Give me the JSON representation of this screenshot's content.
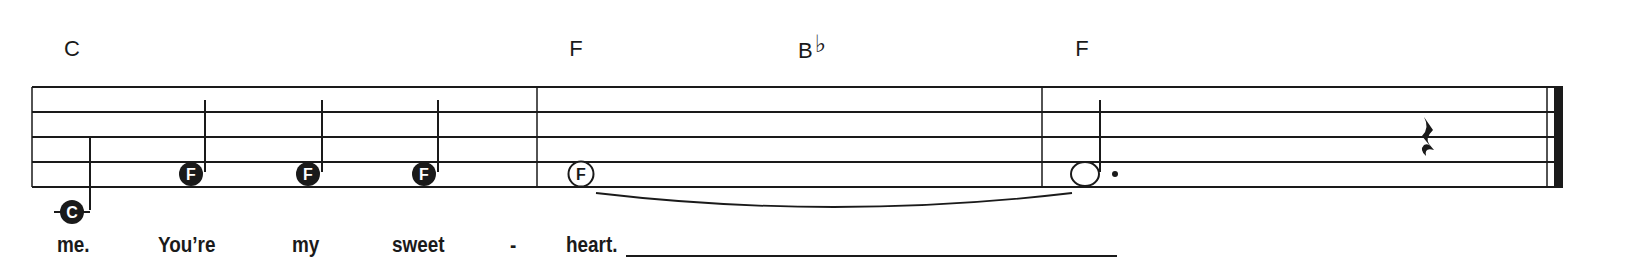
{
  "colors": {
    "ink": "#1a1a1a",
    "paper": "#ffffff",
    "note_label": "#ffffff"
  },
  "staff": {
    "left": 32,
    "right": 1563,
    "lines_y": [
      87,
      112,
      137,
      162,
      187
    ]
  },
  "chords": [
    {
      "root": "C",
      "accidental": "",
      "x": 72
    },
    {
      "root": "F",
      "accidental": "",
      "x": 576
    },
    {
      "root": "B",
      "accidental": "♭",
      "x": 812
    },
    {
      "root": "F",
      "accidental": "",
      "x": 1082
    }
  ],
  "barlines": [
    537,
    1042
  ],
  "final_barline": {
    "thin_x": 1547,
    "thick_x1": 1554,
    "thick_x2": 1563
  },
  "notes": [
    {
      "name": "C",
      "type": "quarter",
      "x": 72,
      "y": 212,
      "ledger": true,
      "stem_x": 90,
      "stem_top": 137
    },
    {
      "name": "F",
      "type": "quarter",
      "x": 191,
      "y": 174,
      "stem_x": 205,
      "stem_top": 100
    },
    {
      "name": "F",
      "type": "quarter",
      "x": 308,
      "y": 174,
      "stem_x": 322,
      "stem_top": 100
    },
    {
      "name": "F",
      "type": "quarter",
      "x": 424,
      "y": 174,
      "stem_x": 438,
      "stem_top": 100
    },
    {
      "name": "F",
      "type": "whole",
      "x": 581,
      "y": 174
    },
    {
      "name": "",
      "type": "dotted-half",
      "x": 1085,
      "y": 174,
      "stem_x": 1100,
      "stem_top": 100,
      "dot_x": 1115
    }
  ],
  "rest": {
    "type": "quarter-rest",
    "x": 1428
  },
  "tie": {
    "from_x": 596,
    "to_x": 1072,
    "y": 193,
    "depth": 14
  },
  "lyrics": [
    {
      "text": "me.",
      "x": 57
    },
    {
      "text": "You’re",
      "x": 158
    },
    {
      "text": "my",
      "x": 292
    },
    {
      "text": "sweet",
      "x": 392
    },
    {
      "text": "-",
      "x": 510
    },
    {
      "text": "heart.",
      "x": 566
    }
  ],
  "extender": {
    "x1": 626,
    "x2": 1117,
    "y": 256
  }
}
